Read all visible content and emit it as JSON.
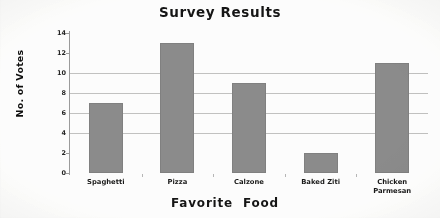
{
  "chart_data": {
    "type": "bar",
    "title": "Survey Results",
    "xlabel": "Favorite Food",
    "ylabel": "No. of Votes",
    "categories": [
      "Spaghetti",
      "Pizza",
      "Calzone",
      "Baked Ziti",
      "Chicken Parmesan"
    ],
    "category_lines": [
      [
        "Spaghetti"
      ],
      [
        "Pizza"
      ],
      [
        "Calzone"
      ],
      [
        "Baked Ziti"
      ],
      [
        "Chicken",
        "Parmesan"
      ]
    ],
    "values": [
      7,
      13,
      9,
      2,
      11
    ],
    "ylim": [
      0,
      14
    ],
    "yticks": [
      0,
      2,
      4,
      6,
      8,
      10,
      12,
      14
    ],
    "ytick_labels": [
      "0",
      "2",
      "4",
      "6",
      "8",
      "10",
      "12",
      "14"
    ],
    "gridlines_at": [
      4,
      6,
      8,
      10
    ],
    "grid": true,
    "legend": "none",
    "bar_color": "#8c8c8c",
    "background_color": "#ffffff",
    "axis_color": "#9b9b9b"
  }
}
